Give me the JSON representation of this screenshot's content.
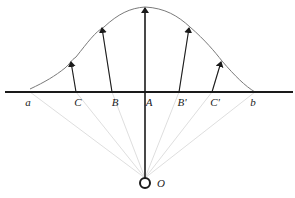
{
  "diagram": {
    "colors": {
      "axis": "#1a1a1a",
      "curve": "#7a7a7a",
      "arrow": "#1a1a1a",
      "ray": "#d6d6d6",
      "source": "#1a1a1a"
    },
    "axis": {
      "y": 92,
      "x1": 5,
      "x2": 293
    },
    "source": {
      "label": "O",
      "x": 145,
      "y": 183,
      "r": 5
    },
    "curve_path": "M30,89 C45,82 55,76 65,68 C70,64 71,60 76,57 C88,42 95,32 104,27 C118,14 130,8 145,7 C165,8 178,16 190,27 C205,40 215,52 222,61 C235,76 245,86 255,92",
    "points": [
      {
        "id": "a",
        "label": "a",
        "x": 30,
        "label_x": 28,
        "arrow": null
      },
      {
        "id": "C",
        "label": "C",
        "x": 76,
        "label_x": 78,
        "arrow": {
          "x1": 76,
          "y1": 92,
          "x2": 71,
          "y2": 62
        }
      },
      {
        "id": "B",
        "label": "B",
        "x": 112,
        "label_x": 115,
        "arrow": {
          "x1": 112,
          "y1": 92,
          "x2": 102,
          "y2": 28
        }
      },
      {
        "id": "A",
        "label": "A",
        "x": 145,
        "label_x": 149,
        "arrow": {
          "x1": 145,
          "y1": 183,
          "x2": 145,
          "y2": 8
        }
      },
      {
        "id": "Bp",
        "label": "B'",
        "x": 179,
        "label_x": 182,
        "arrow": {
          "x1": 179,
          "y1": 92,
          "x2": 189,
          "y2": 28
        }
      },
      {
        "id": "Cp",
        "label": "C'",
        "x": 212,
        "label_x": 215,
        "arrow": {
          "x1": 212,
          "y1": 92,
          "x2": 221,
          "y2": 62
        }
      },
      {
        "id": "b",
        "label": "b",
        "x": 255,
        "label_x": 253,
        "arrow": null
      }
    ],
    "label_y": 106
  }
}
